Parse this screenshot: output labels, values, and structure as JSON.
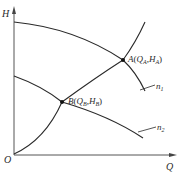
{
  "axes": {
    "y_label": "H",
    "x_label": "Q",
    "origin_label": "O"
  },
  "curves": [
    {
      "id": "n1",
      "label_main": "n",
      "label_sub": "1",
      "kind": "pump-curve"
    },
    {
      "id": "n2",
      "label_main": "n",
      "label_sub": "2",
      "kind": "pump-curve"
    },
    {
      "id": "system",
      "kind": "system-curve"
    }
  ],
  "points": {
    "A": {
      "name": "A",
      "q": "Q",
      "q_sub": "A",
      "h": "H",
      "h_sub": "A"
    },
    "B": {
      "name": "B",
      "q": "Q",
      "q_sub": "B",
      "h": "H",
      "h_sub": "B"
    }
  },
  "colors": {
    "line": "#2a2a2a",
    "axis": "#555555",
    "background": "#ffffff"
  }
}
